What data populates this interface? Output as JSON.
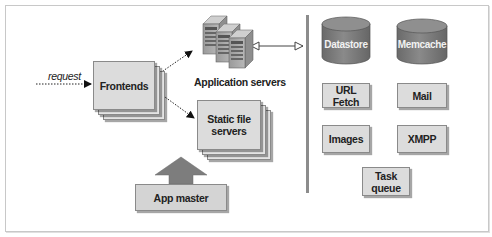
{
  "diagram": {
    "request_label": "request",
    "frontends": "Frontends",
    "app_servers": "Application servers",
    "static_servers_line1": "Static file",
    "static_servers_line2": "servers",
    "app_master": "App master",
    "services": {
      "datastore": "Datastore",
      "memcache": "Memcache",
      "url_fetch": "URL Fetch",
      "mail": "Mail",
      "images": "Images",
      "xmpp": "XMPP",
      "task_queue_line1": "Task",
      "task_queue_line2": "queue"
    },
    "colors": {
      "box_fill": "#dcdcdc",
      "box_border": "#8a8a8a",
      "cylinder_fill": "#7a7a7a",
      "separator": "#8c8c8c",
      "arrow_fill": "#7d7d7d"
    }
  }
}
